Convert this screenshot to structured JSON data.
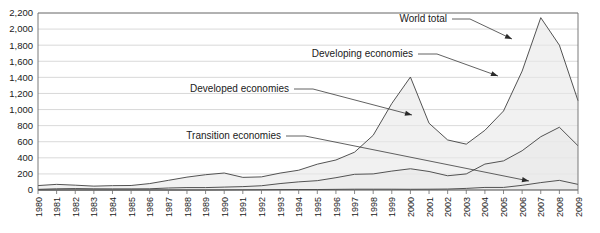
{
  "chart_data": {
    "type": "area",
    "stacked": true,
    "title": "",
    "subtitle": "",
    "xlabel": "",
    "ylabel": "",
    "ylim": [
      0,
      2200
    ],
    "ytick_step": 200,
    "grid": true,
    "legend_position": "inline-annotations",
    "x": [
      1980,
      1981,
      1982,
      1983,
      1984,
      1985,
      1986,
      1987,
      1988,
      1989,
      1990,
      1991,
      1992,
      1993,
      1994,
      1995,
      1996,
      1997,
      1998,
      1999,
      2000,
      2001,
      2002,
      2003,
      2004,
      2005,
      2006,
      2007,
      2008,
      2009
    ],
    "categories": [
      "1980",
      "1981",
      "1982",
      "1983",
      "1984",
      "1985",
      "1986",
      "1987",
      "1988",
      "1989",
      "1990",
      "1991",
      "1992",
      "1993",
      "1994",
      "1995",
      "1996",
      "1997",
      "1998",
      "1999",
      "2000",
      "2001",
      "2002",
      "2003",
      "2004",
      "2005",
      "2006",
      "2007",
      "2008",
      "2009"
    ],
    "yticks": [
      "0",
      "200",
      "400",
      "600",
      "800",
      "1,000",
      "1,200",
      "1,400",
      "1,600",
      "1,800",
      "2,000",
      "2,200"
    ],
    "series": [
      {
        "name": "Developed economies",
        "values": [
          47,
          55,
          42,
          33,
          40,
          42,
          65,
          95,
          130,
          160,
          175,
          115,
          110,
          130,
          145,
          205,
          220,
          275,
          480,
          840,
          1140,
          600,
          445,
          370,
          420,
          620,
          990,
          1480,
          1020,
          560
        ]
      },
      {
        "name": "Developing economies",
        "values": [
          8,
          15,
          18,
          15,
          14,
          14,
          15,
          25,
          30,
          30,
          35,
          40,
          50,
          75,
          95,
          110,
          145,
          185,
          190,
          225,
          255,
          220,
          165,
          180,
          290,
          330,
          430,
          570,
          660,
          480
        ]
      },
      {
        "name": "Transition economies",
        "values": [
          0,
          0,
          0,
          0,
          0,
          0,
          0,
          0,
          0,
          0,
          1,
          2,
          3,
          5,
          6,
          6,
          8,
          10,
          10,
          10,
          9,
          10,
          12,
          20,
          32,
          32,
          58,
          92,
          120,
          70
        ]
      }
    ],
    "totals": {
      "name": "World total",
      "values": [
        55,
        70,
        60,
        48,
        54,
        56,
        80,
        120,
        160,
        190,
        211,
        157,
        163,
        210,
        246,
        321,
        373,
        470,
        680,
        1075,
        1404,
        830,
        622,
        570,
        742,
        982,
        1478,
        2142,
        1800,
        1110
      ]
    },
    "annotations": [
      {
        "label": "World total",
        "points_to": "world-total-2007-peak"
      },
      {
        "label": "Developing economies",
        "points_to": "developing-band-2007"
      },
      {
        "label": "Developed economies",
        "points_to": "developed-band-2000"
      },
      {
        "label": "Transition economies",
        "points_to": "transition-band-2007"
      }
    ]
  },
  "colors": {
    "area_fill": "#e8e8e8",
    "line": "#4a4a4a",
    "grid": "#c8c8c8",
    "text": "#1a1a1a",
    "frame": "#6b6b6b"
  }
}
